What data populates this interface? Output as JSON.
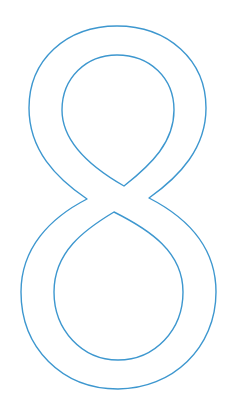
{
  "glyph": {
    "character": "8",
    "style": "outline",
    "stroke_color": "#3d97cf",
    "background_color": "#ffffff"
  }
}
